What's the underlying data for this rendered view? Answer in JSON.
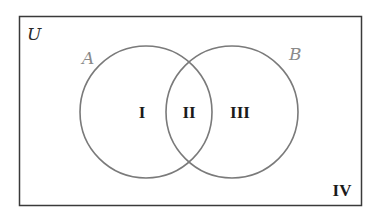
{
  "diagram": {
    "type": "venn",
    "universe": {
      "label": "U"
    },
    "sets": [
      {
        "label": "A",
        "region": "left"
      },
      {
        "label": "B",
        "region": "right"
      }
    ],
    "regions": [
      {
        "id": "I",
        "label": "I",
        "description": "A only"
      },
      {
        "id": "II",
        "label": "II",
        "description": "A and B"
      },
      {
        "id": "III",
        "label": "III",
        "description": "B only"
      },
      {
        "id": "IV",
        "label": "IV",
        "description": "neither A nor B"
      }
    ],
    "colors": {
      "frame": "#3a3a3a",
      "circle": "#7a7a7a",
      "set_label": "#8a8a8a",
      "region_label": "#1a1a1a"
    }
  }
}
